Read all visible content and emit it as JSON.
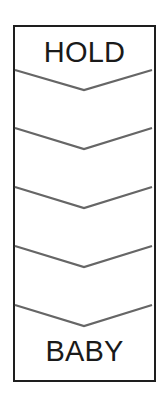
{
  "diagram": {
    "type": "chevron-strip",
    "top_label": "HOLD",
    "bottom_label": "BABY",
    "chevron_count": 5,
    "colors": {
      "frame_border": "#1e1e1e",
      "chevron_stroke": "#666666",
      "text": "#1a1a1a",
      "background": "#ffffff"
    }
  }
}
